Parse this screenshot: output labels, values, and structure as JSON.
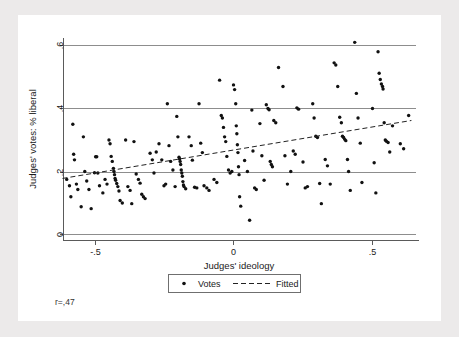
{
  "figure": {
    "background_color": "#ffffff",
    "frame_color": "#eceaea"
  },
  "annotations": {
    "correlation_label": "r=,47"
  },
  "legend": {
    "entries": [
      {
        "label": "Votes",
        "marker": "dot",
        "color": "#111111"
      },
      {
        "label": "Fitted",
        "marker": "dashed-line",
        "color": "#222222"
      }
    ]
  },
  "chart_data": {
    "type": "scatter",
    "title": "",
    "xlabel": "Judges' ideology",
    "ylabel": "Judges' votes: % liberal",
    "xlim": [
      -0.62,
      0.66
    ],
    "ylim": [
      -0.02,
      0.625
    ],
    "xticks": [
      -0.5,
      0,
      0.5
    ],
    "xticklabels": [
      "-.5",
      "0",
      ".5"
    ],
    "yticks": [
      0,
      0.2,
      0.4,
      0.6
    ],
    "yticklabels": [
      "0",
      ".2",
      ".4",
      ".6"
    ],
    "grid": true,
    "grid_axis": "y",
    "legend_position": "below-axis-center",
    "correlation": 0.47,
    "series": [
      {
        "name": "Votes",
        "type": "scatter",
        "marker": "dot",
        "color": "#111111",
        "points": [
          [
            -0.6,
            0.175
          ],
          [
            -0.59,
            0.155
          ],
          [
            -0.585,
            0.12
          ],
          [
            -0.578,
            0.35
          ],
          [
            -0.575,
            0.255
          ],
          [
            -0.572,
            0.237
          ],
          [
            -0.565,
            0.16
          ],
          [
            -0.56,
            0.143
          ],
          [
            -0.548,
            0.088
          ],
          [
            -0.54,
            0.31
          ],
          [
            -0.535,
            0.2
          ],
          [
            -0.528,
            0.17
          ],
          [
            -0.52,
            0.143
          ],
          [
            -0.512,
            0.082
          ],
          [
            -0.5,
            0.196
          ],
          [
            -0.496,
            0.247
          ],
          [
            -0.492,
            0.247
          ],
          [
            -0.488,
            0.195
          ],
          [
            -0.482,
            0.155
          ],
          [
            -0.47,
            0.132
          ],
          [
            -0.462,
            0.175
          ],
          [
            -0.455,
            0.16
          ],
          [
            -0.448,
            0.3
          ],
          [
            -0.444,
            0.288
          ],
          [
            -0.44,
            0.248
          ],
          [
            -0.436,
            0.232
          ],
          [
            -0.432,
            0.21
          ],
          [
            -0.43,
            0.2
          ],
          [
            -0.428,
            0.19
          ],
          [
            -0.426,
            0.178
          ],
          [
            -0.424,
            0.172
          ],
          [
            -0.42,
            0.162
          ],
          [
            -0.416,
            0.152
          ],
          [
            -0.412,
            0.138
          ],
          [
            -0.408,
            0.108
          ],
          [
            -0.4,
            0.1
          ],
          [
            -0.388,
            0.3
          ],
          [
            -0.38,
            0.152
          ],
          [
            -0.372,
            0.14
          ],
          [
            -0.366,
            0.098
          ],
          [
            -0.358,
            0.295
          ],
          [
            -0.35,
            0.192
          ],
          [
            -0.342,
            0.175
          ],
          [
            -0.336,
            0.163
          ],
          [
            -0.33,
            0.128
          ],
          [
            -0.324,
            0.12
          ],
          [
            -0.318,
            0.114
          ],
          [
            -0.3,
            0.258
          ],
          [
            -0.292,
            0.237
          ],
          [
            -0.286,
            0.195
          ],
          [
            -0.278,
            0.262
          ],
          [
            -0.268,
            0.288
          ],
          [
            -0.258,
            0.237
          ],
          [
            -0.25,
            0.155
          ],
          [
            -0.244,
            0.16
          ],
          [
            -0.238,
            0.415
          ],
          [
            -0.232,
            0.282
          ],
          [
            -0.226,
            0.232
          ],
          [
            -0.218,
            0.205
          ],
          [
            -0.21,
            0.152
          ],
          [
            -0.204,
            0.375
          ],
          [
            -0.2,
            0.31
          ],
          [
            -0.196,
            0.245
          ],
          [
            -0.194,
            0.24
          ],
          [
            -0.192,
            0.232
          ],
          [
            -0.19,
            0.222
          ],
          [
            -0.188,
            0.205
          ],
          [
            -0.186,
            0.195
          ],
          [
            -0.184,
            0.185
          ],
          [
            -0.182,
            0.168
          ],
          [
            -0.18,
            0.157
          ],
          [
            -0.178,
            0.152
          ],
          [
            -0.172,
            0.145
          ],
          [
            -0.16,
            0.31
          ],
          [
            -0.152,
            0.282
          ],
          [
            -0.148,
            0.236
          ],
          [
            -0.14,
            0.15
          ],
          [
            -0.132,
            0.148
          ],
          [
            -0.124,
            0.415
          ],
          [
            -0.118,
            0.29
          ],
          [
            -0.112,
            0.26
          ],
          [
            -0.106,
            0.155
          ],
          [
            -0.096,
            0.148
          ],
          [
            -0.088,
            0.14
          ],
          [
            -0.07,
            0.175
          ],
          [
            -0.06,
            0.165
          ],
          [
            -0.05,
            0.49
          ],
          [
            -0.044,
            0.378
          ],
          [
            -0.04,
            0.37
          ],
          [
            -0.036,
            0.34
          ],
          [
            -0.032,
            0.31
          ],
          [
            -0.028,
            0.295
          ],
          [
            -0.024,
            0.248
          ],
          [
            -0.018,
            0.205
          ],
          [
            -0.012,
            0.195
          ],
          [
            -0.006,
            0.2
          ],
          [
            0.0,
            0.475
          ],
          [
            0.004,
            0.46
          ],
          [
            0.008,
            0.415
          ],
          [
            0.01,
            0.345
          ],
          [
            0.012,
            0.32
          ],
          [
            0.014,
            0.285
          ],
          [
            0.016,
            0.26
          ],
          [
            0.018,
            0.215
          ],
          [
            0.02,
            0.19
          ],
          [
            0.022,
            0.12
          ],
          [
            0.026,
            0.09
          ],
          [
            0.04,
            0.235
          ],
          [
            0.05,
            0.2
          ],
          [
            0.058,
            0.045
          ],
          [
            0.066,
            0.395
          ],
          [
            0.07,
            0.265
          ],
          [
            0.076,
            0.148
          ],
          [
            0.082,
            0.143
          ],
          [
            0.095,
            0.352
          ],
          [
            0.102,
            0.25
          ],
          [
            0.11,
            0.172
          ],
          [
            0.118,
            0.412
          ],
          [
            0.124,
            0.4
          ],
          [
            0.128,
            0.396
          ],
          [
            0.132,
            0.232
          ],
          [
            0.136,
            0.222
          ],
          [
            0.14,
            0.215
          ],
          [
            0.145,
            0.362
          ],
          [
            0.152,
            0.355
          ],
          [
            0.162,
            0.53
          ],
          [
            0.178,
            0.47
          ],
          [
            0.185,
            0.25
          ],
          [
            0.194,
            0.16
          ],
          [
            0.206,
            0.2
          ],
          [
            0.215,
            0.265
          ],
          [
            0.222,
            0.255
          ],
          [
            0.228,
            0.402
          ],
          [
            0.234,
            0.398
          ],
          [
            0.25,
            0.23
          ],
          [
            0.258,
            0.148
          ],
          [
            0.266,
            0.152
          ],
          [
            0.285,
            0.415
          ],
          [
            0.29,
            0.37
          ],
          [
            0.296,
            0.312
          ],
          [
            0.302,
            0.308
          ],
          [
            0.31,
            0.162
          ],
          [
            0.316,
            0.098
          ],
          [
            0.33,
            0.238
          ],
          [
            0.338,
            0.218
          ],
          [
            0.348,
            0.16
          ],
          [
            0.362,
            0.545
          ],
          [
            0.368,
            0.538
          ],
          [
            0.375,
            0.47
          ],
          [
            0.382,
            0.372
          ],
          [
            0.388,
            0.355
          ],
          [
            0.392,
            0.312
          ],
          [
            0.396,
            0.308
          ],
          [
            0.4,
            0.302
          ],
          [
            0.404,
            0.298
          ],
          [
            0.41,
            0.238
          ],
          [
            0.414,
            0.2
          ],
          [
            0.42,
            0.14
          ],
          [
            0.436,
            0.61
          ],
          [
            0.442,
            0.448
          ],
          [
            0.448,
            0.37
          ],
          [
            0.456,
            0.29
          ],
          [
            0.462,
            0.165
          ],
          [
            0.5,
            0.4
          ],
          [
            0.506,
            0.228
          ],
          [
            0.512,
            0.132
          ],
          [
            0.52,
            0.58
          ],
          [
            0.524,
            0.512
          ],
          [
            0.528,
            0.492
          ],
          [
            0.532,
            0.478
          ],
          [
            0.536,
            0.47
          ],
          [
            0.538,
            0.462
          ],
          [
            0.542,
            0.355
          ],
          [
            0.546,
            0.3
          ],
          [
            0.55,
            0.296
          ],
          [
            0.556,
            0.292
          ],
          [
            0.562,
            0.262
          ],
          [
            0.572,
            0.345
          ],
          [
            0.6,
            0.288
          ],
          [
            0.612,
            0.272
          ],
          [
            0.63,
            0.378
          ]
        ]
      },
      {
        "name": "Fitted",
        "type": "line",
        "style": "dashed",
        "color": "#222222",
        "x": [
          -0.615,
          0.64
        ],
        "y": [
          0.178,
          0.362
        ]
      }
    ]
  }
}
